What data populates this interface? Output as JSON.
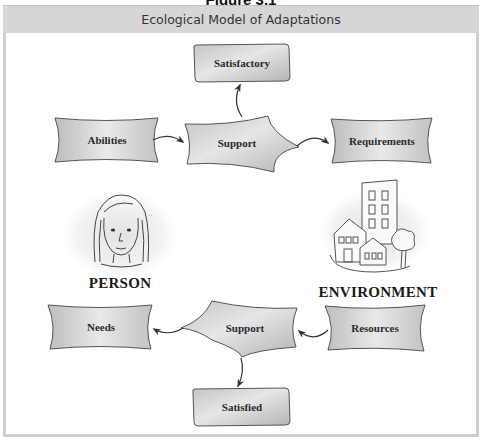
{
  "figure_caption": "Figure 3.1",
  "header": {
    "title": "Ecological Model of Adaptations"
  },
  "nodes": {
    "satisfactory": "Satisfactory",
    "abilities": "Abilities",
    "support_top": "Support",
    "requirements": "Requirements",
    "needs": "Needs",
    "support_bottom": "Support",
    "resources": "Resources",
    "satisfied": "Satisfied"
  },
  "entities": {
    "person": {
      "label": "PERSON",
      "icon": "woman-face-icon"
    },
    "environment": {
      "label": "ENVIRONMENT",
      "icon": "buildings-tree-icon"
    }
  },
  "edges": [
    {
      "from": "Abilities",
      "to": "Support (top)"
    },
    {
      "from": "Support (top)",
      "to": "Requirements"
    },
    {
      "from": "Support (top)",
      "to": "Satisfactory"
    },
    {
      "from": "Resources",
      "to": "Support (bottom)"
    },
    {
      "from": "Support (bottom)",
      "to": "Needs"
    },
    {
      "from": "Support (bottom)",
      "to": "Satisfied"
    }
  ],
  "colors": {
    "header_band": "#d6d6d6",
    "frame_border": "#cfcfcf",
    "node_fill_light": "#ececec",
    "node_fill_dark": "#b9b9b9",
    "node_stroke": "#4a4a4a"
  }
}
